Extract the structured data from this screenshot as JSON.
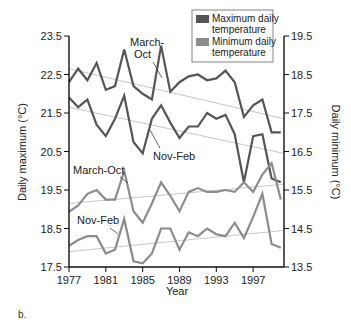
{
  "panel_label": "b.",
  "legend": {
    "items": [
      {
        "label_line1": "Maximum daily",
        "label_line2": "temperature",
        "color": "#555555"
      },
      {
        "label_line1": "Minimum daily",
        "label_line2": "temperature",
        "color": "#8c8c8c"
      }
    ]
  },
  "annotations": {
    "max_march_oct": "March-",
    "max_march_oct_2": "Oct",
    "max_nov_feb": "Nov-Feb",
    "min_march_oct": "March-Oct",
    "min_nov_feb": "Nov-Feb"
  },
  "chart_data": {
    "type": "line",
    "title": "",
    "xlabel": "Year",
    "ylabel": "Daily maximum (°C)",
    "ylabel_right": "Daily minimum (°C)",
    "x": [
      1977,
      1978,
      1979,
      1980,
      1981,
      1982,
      1983,
      1984,
      1985,
      1986,
      1987,
      1988,
      1989,
      1990,
      1991,
      1992,
      1993,
      1994,
      1995,
      1996,
      1997,
      1998,
      1999,
      2000
    ],
    "x_ticks": [
      "1977",
      "1981",
      "1985",
      "1989",
      "1993",
      "1997"
    ],
    "ylim_left": [
      17.5,
      23.5
    ],
    "yticks_left": [
      "23.5",
      "22.5",
      "21.5",
      "20.5",
      "19.5",
      "18.5",
      "17.5"
    ],
    "ylim_right": [
      13.5,
      19.5
    ],
    "yticks_right": [
      "19.5",
      "18.5",
      "17.5",
      "16.5",
      "15.5",
      "14.5",
      "13.5"
    ],
    "grid": false,
    "legend_position": "top-right",
    "series": [
      {
        "name": "Maximum daily temperature, March-Oct",
        "axis": "left",
        "color": "#555555",
        "values": [
          22.3,
          22.65,
          22.35,
          22.8,
          22.1,
          22.2,
          23.15,
          22.2,
          22.0,
          21.85,
          23.25,
          22.05,
          22.3,
          22.45,
          22.5,
          22.35,
          22.4,
          22.6,
          22.3,
          21.4,
          21.7,
          21.85,
          21.0,
          21.0
        ],
        "trend": [
          22.65,
          21.35
        ]
      },
      {
        "name": "Maximum daily temperature, Nov-Feb",
        "axis": "left",
        "color": "#555555",
        "values": [
          21.9,
          21.65,
          21.85,
          21.2,
          20.9,
          21.35,
          21.95,
          20.75,
          20.45,
          21.35,
          21.7,
          21.25,
          20.85,
          21.15,
          21.15,
          21.5,
          21.35,
          21.45,
          20.95,
          19.7,
          20.9,
          20.95,
          19.8,
          19.7
        ],
        "trend": [
          21.65,
          20.45
        ]
      },
      {
        "name": "Minimum daily temperature, March-Oct",
        "axis": "right",
        "color": "#8c8c8c",
        "values": [
          14.93,
          15.1,
          15.4,
          15.5,
          15.25,
          15.25,
          16.0,
          14.95,
          14.65,
          15.15,
          15.7,
          15.35,
          14.95,
          15.45,
          15.55,
          15.45,
          15.45,
          15.5,
          15.45,
          15.7,
          15.45,
          15.9,
          16.2,
          15.25
        ],
        "trend": [
          15.15,
          15.65
        ]
      },
      {
        "name": "Minimum daily temperature, Nov-Feb",
        "axis": "right",
        "color": "#8c8c8c",
        "values": [
          14.05,
          14.2,
          14.3,
          14.3,
          13.85,
          13.95,
          14.75,
          13.65,
          13.6,
          13.85,
          14.5,
          14.5,
          13.95,
          14.4,
          14.3,
          14.5,
          14.35,
          14.3,
          14.65,
          14.25,
          14.8,
          15.4,
          14.1,
          14.0
        ],
        "trend": [
          13.9,
          14.45
        ]
      }
    ]
  }
}
